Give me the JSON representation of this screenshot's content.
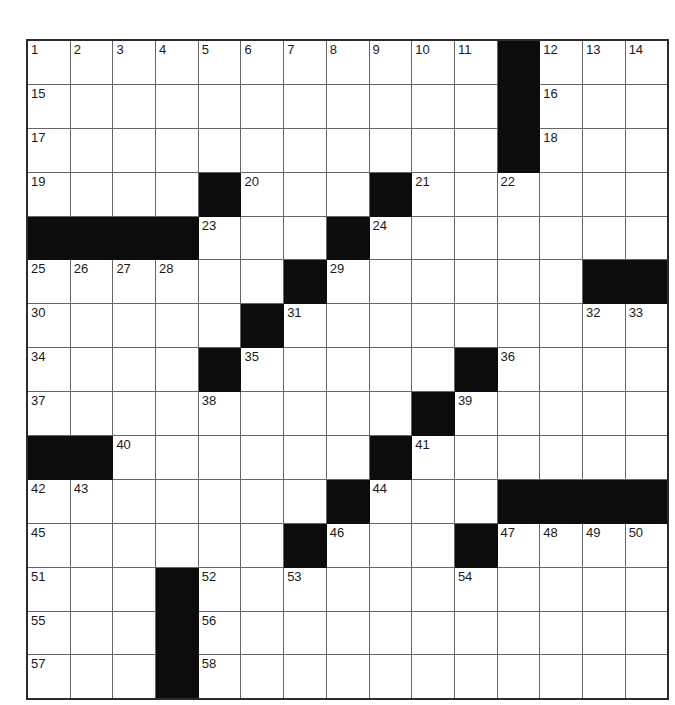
{
  "puzzle": {
    "title": "Crossword Grid",
    "rows": 15,
    "columns": 15,
    "cell_size_px": 41.7,
    "colors": {
      "background": "#ffffff",
      "block": "#0c0c0c",
      "grid_line": "#666666",
      "border": "#2b2b2b",
      "number_text": "#1a1a1a"
    },
    "highest_clue_number": 58,
    "grid": [
      [
        {
          "block": false,
          "number": "1"
        },
        {
          "block": false,
          "number": "2"
        },
        {
          "block": false,
          "number": "3"
        },
        {
          "block": false,
          "number": "4"
        },
        {
          "block": false,
          "number": "5"
        },
        {
          "block": false,
          "number": "6"
        },
        {
          "block": false,
          "number": "7"
        },
        {
          "block": false,
          "number": "8"
        },
        {
          "block": false,
          "number": "9"
        },
        {
          "block": false,
          "number": "10"
        },
        {
          "block": false,
          "number": "11"
        },
        {
          "block": true,
          "number": ""
        },
        {
          "block": false,
          "number": "12"
        },
        {
          "block": false,
          "number": "13"
        },
        {
          "block": false,
          "number": "14"
        }
      ],
      [
        {
          "block": false,
          "number": "15"
        },
        {
          "block": false,
          "number": ""
        },
        {
          "block": false,
          "number": ""
        },
        {
          "block": false,
          "number": ""
        },
        {
          "block": false,
          "number": ""
        },
        {
          "block": false,
          "number": ""
        },
        {
          "block": false,
          "number": ""
        },
        {
          "block": false,
          "number": ""
        },
        {
          "block": false,
          "number": ""
        },
        {
          "block": false,
          "number": ""
        },
        {
          "block": false,
          "number": ""
        },
        {
          "block": true,
          "number": ""
        },
        {
          "block": false,
          "number": "16"
        },
        {
          "block": false,
          "number": ""
        },
        {
          "block": false,
          "number": ""
        }
      ],
      [
        {
          "block": false,
          "number": "17"
        },
        {
          "block": false,
          "number": ""
        },
        {
          "block": false,
          "number": ""
        },
        {
          "block": false,
          "number": ""
        },
        {
          "block": false,
          "number": ""
        },
        {
          "block": false,
          "number": ""
        },
        {
          "block": false,
          "number": ""
        },
        {
          "block": false,
          "number": ""
        },
        {
          "block": false,
          "number": ""
        },
        {
          "block": false,
          "number": ""
        },
        {
          "block": false,
          "number": ""
        },
        {
          "block": true,
          "number": ""
        },
        {
          "block": false,
          "number": "18"
        },
        {
          "block": false,
          "number": ""
        },
        {
          "block": false,
          "number": ""
        }
      ],
      [
        {
          "block": false,
          "number": "19"
        },
        {
          "block": false,
          "number": ""
        },
        {
          "block": false,
          "number": ""
        },
        {
          "block": false,
          "number": ""
        },
        {
          "block": true,
          "number": ""
        },
        {
          "block": false,
          "number": "20"
        },
        {
          "block": false,
          "number": ""
        },
        {
          "block": false,
          "number": ""
        },
        {
          "block": true,
          "number": ""
        },
        {
          "block": false,
          "number": "21"
        },
        {
          "block": false,
          "number": ""
        },
        {
          "block": false,
          "number": "22"
        },
        {
          "block": false,
          "number": ""
        },
        {
          "block": false,
          "number": ""
        },
        {
          "block": false,
          "number": ""
        }
      ],
      [
        {
          "block": true,
          "number": ""
        },
        {
          "block": true,
          "number": ""
        },
        {
          "block": true,
          "number": ""
        },
        {
          "block": true,
          "number": ""
        },
        {
          "block": false,
          "number": "23"
        },
        {
          "block": false,
          "number": ""
        },
        {
          "block": false,
          "number": ""
        },
        {
          "block": true,
          "number": ""
        },
        {
          "block": false,
          "number": "24"
        },
        {
          "block": false,
          "number": ""
        },
        {
          "block": false,
          "number": ""
        },
        {
          "block": false,
          "number": ""
        },
        {
          "block": false,
          "number": ""
        },
        {
          "block": false,
          "number": ""
        },
        {
          "block": false,
          "number": ""
        }
      ],
      [
        {
          "block": false,
          "number": "25"
        },
        {
          "block": false,
          "number": "26"
        },
        {
          "block": false,
          "number": "27"
        },
        {
          "block": false,
          "number": "28"
        },
        {
          "block": false,
          "number": ""
        },
        {
          "block": false,
          "number": ""
        },
        {
          "block": true,
          "number": ""
        },
        {
          "block": false,
          "number": "29"
        },
        {
          "block": false,
          "number": ""
        },
        {
          "block": false,
          "number": ""
        },
        {
          "block": false,
          "number": ""
        },
        {
          "block": false,
          "number": ""
        },
        {
          "block": false,
          "number": ""
        },
        {
          "block": true,
          "number": ""
        },
        {
          "block": true,
          "number": ""
        }
      ],
      [
        {
          "block": false,
          "number": "30"
        },
        {
          "block": false,
          "number": ""
        },
        {
          "block": false,
          "number": ""
        },
        {
          "block": false,
          "number": ""
        },
        {
          "block": false,
          "number": ""
        },
        {
          "block": true,
          "number": ""
        },
        {
          "block": false,
          "number": "31"
        },
        {
          "block": false,
          "number": ""
        },
        {
          "block": false,
          "number": ""
        },
        {
          "block": false,
          "number": ""
        },
        {
          "block": false,
          "number": ""
        },
        {
          "block": false,
          "number": ""
        },
        {
          "block": false,
          "number": ""
        },
        {
          "block": false,
          "number": "32"
        },
        {
          "block": false,
          "number": "33"
        }
      ],
      [
        {
          "block": false,
          "number": "34"
        },
        {
          "block": false,
          "number": ""
        },
        {
          "block": false,
          "number": ""
        },
        {
          "block": false,
          "number": ""
        },
        {
          "block": true,
          "number": ""
        },
        {
          "block": false,
          "number": "35"
        },
        {
          "block": false,
          "number": ""
        },
        {
          "block": false,
          "number": ""
        },
        {
          "block": false,
          "number": ""
        },
        {
          "block": false,
          "number": ""
        },
        {
          "block": true,
          "number": ""
        },
        {
          "block": false,
          "number": "36"
        },
        {
          "block": false,
          "number": ""
        },
        {
          "block": false,
          "number": ""
        },
        {
          "block": false,
          "number": ""
        }
      ],
      [
        {
          "block": false,
          "number": "37"
        },
        {
          "block": false,
          "number": ""
        },
        {
          "block": false,
          "number": ""
        },
        {
          "block": false,
          "number": ""
        },
        {
          "block": false,
          "number": "38"
        },
        {
          "block": false,
          "number": ""
        },
        {
          "block": false,
          "number": ""
        },
        {
          "block": false,
          "number": ""
        },
        {
          "block": false,
          "number": ""
        },
        {
          "block": true,
          "number": ""
        },
        {
          "block": false,
          "number": "39"
        },
        {
          "block": false,
          "number": ""
        },
        {
          "block": false,
          "number": ""
        },
        {
          "block": false,
          "number": ""
        },
        {
          "block": false,
          "number": ""
        }
      ],
      [
        {
          "block": true,
          "number": ""
        },
        {
          "block": true,
          "number": ""
        },
        {
          "block": false,
          "number": "40"
        },
        {
          "block": false,
          "number": ""
        },
        {
          "block": false,
          "number": ""
        },
        {
          "block": false,
          "number": ""
        },
        {
          "block": false,
          "number": ""
        },
        {
          "block": false,
          "number": ""
        },
        {
          "block": true,
          "number": ""
        },
        {
          "block": false,
          "number": "41"
        },
        {
          "block": false,
          "number": ""
        },
        {
          "block": false,
          "number": ""
        },
        {
          "block": false,
          "number": ""
        },
        {
          "block": false,
          "number": ""
        },
        {
          "block": false,
          "number": ""
        }
      ],
      [
        {
          "block": false,
          "number": "42"
        },
        {
          "block": false,
          "number": "43"
        },
        {
          "block": false,
          "number": ""
        },
        {
          "block": false,
          "number": ""
        },
        {
          "block": false,
          "number": ""
        },
        {
          "block": false,
          "number": ""
        },
        {
          "block": false,
          "number": ""
        },
        {
          "block": true,
          "number": ""
        },
        {
          "block": false,
          "number": "44"
        },
        {
          "block": false,
          "number": ""
        },
        {
          "block": false,
          "number": ""
        },
        {
          "block": true,
          "number": ""
        },
        {
          "block": true,
          "number": ""
        },
        {
          "block": true,
          "number": ""
        },
        {
          "block": true,
          "number": ""
        }
      ],
      [
        {
          "block": false,
          "number": "45"
        },
        {
          "block": false,
          "number": ""
        },
        {
          "block": false,
          "number": ""
        },
        {
          "block": false,
          "number": ""
        },
        {
          "block": false,
          "number": ""
        },
        {
          "block": false,
          "number": ""
        },
        {
          "block": true,
          "number": ""
        },
        {
          "block": false,
          "number": "46"
        },
        {
          "block": false,
          "number": ""
        },
        {
          "block": false,
          "number": ""
        },
        {
          "block": true,
          "number": ""
        },
        {
          "block": false,
          "number": "47"
        },
        {
          "block": false,
          "number": "48"
        },
        {
          "block": false,
          "number": "49"
        },
        {
          "block": false,
          "number": "50"
        }
      ],
      [
        {
          "block": false,
          "number": "51"
        },
        {
          "block": false,
          "number": ""
        },
        {
          "block": false,
          "number": ""
        },
        {
          "block": true,
          "number": ""
        },
        {
          "block": false,
          "number": "52"
        },
        {
          "block": false,
          "number": ""
        },
        {
          "block": false,
          "number": "53"
        },
        {
          "block": false,
          "number": ""
        },
        {
          "block": false,
          "number": ""
        },
        {
          "block": false,
          "number": ""
        },
        {
          "block": false,
          "number": "54"
        },
        {
          "block": false,
          "number": ""
        },
        {
          "block": false,
          "number": ""
        },
        {
          "block": false,
          "number": ""
        },
        {
          "block": false,
          "number": ""
        }
      ],
      [
        {
          "block": false,
          "number": "55"
        },
        {
          "block": false,
          "number": ""
        },
        {
          "block": false,
          "number": ""
        },
        {
          "block": true,
          "number": ""
        },
        {
          "block": false,
          "number": "56"
        },
        {
          "block": false,
          "number": ""
        },
        {
          "block": false,
          "number": ""
        },
        {
          "block": false,
          "number": ""
        },
        {
          "block": false,
          "number": ""
        },
        {
          "block": false,
          "number": ""
        },
        {
          "block": false,
          "number": ""
        },
        {
          "block": false,
          "number": ""
        },
        {
          "block": false,
          "number": ""
        },
        {
          "block": false,
          "number": ""
        },
        {
          "block": false,
          "number": ""
        }
      ],
      [
        {
          "block": false,
          "number": "57"
        },
        {
          "block": false,
          "number": ""
        },
        {
          "block": false,
          "number": ""
        },
        {
          "block": true,
          "number": ""
        },
        {
          "block": false,
          "number": "58"
        },
        {
          "block": false,
          "number": ""
        },
        {
          "block": false,
          "number": ""
        },
        {
          "block": false,
          "number": ""
        },
        {
          "block": false,
          "number": ""
        },
        {
          "block": false,
          "number": ""
        },
        {
          "block": false,
          "number": ""
        },
        {
          "block": false,
          "number": ""
        },
        {
          "block": false,
          "number": ""
        },
        {
          "block": false,
          "number": ""
        },
        {
          "block": false,
          "number": ""
        }
      ]
    ]
  }
}
